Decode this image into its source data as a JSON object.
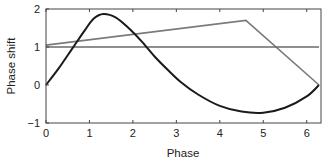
{
  "chart_data": {
    "type": "line",
    "title": "",
    "xlabel": "Phase",
    "ylabel": "Phase shift",
    "xlim": [
      0,
      6.283
    ],
    "ylim": [
      -1,
      2
    ],
    "xticks": [
      0,
      1,
      2,
      3,
      4,
      5,
      6
    ],
    "yticks": [
      -1,
      0,
      1,
      2
    ],
    "xtick_labels": [
      "0",
      "1",
      "2",
      "3",
      "4",
      "5",
      "6"
    ],
    "ytick_labels": [
      "−1",
      "0",
      "1",
      "2"
    ],
    "grid": false,
    "legend": null,
    "series": [
      {
        "name": "phase-response-curve",
        "color": "#1a1a1a",
        "x": [
          0,
          0.3,
          0.6,
          0.9,
          1.1,
          1.32,
          1.6,
          1.9,
          2.2,
          2.5,
          2.8,
          3.1,
          3.5,
          4.0,
          4.5,
          5.0,
          5.5,
          6.0,
          6.283
        ],
        "y": [
          0,
          0.45,
          0.95,
          1.45,
          1.75,
          1.87,
          1.78,
          1.5,
          1.15,
          0.75,
          0.4,
          0.08,
          -0.25,
          -0.55,
          -0.7,
          -0.73,
          -0.6,
          -0.3,
          0.0
        ]
      },
      {
        "name": "sloped-line",
        "color": "#7a7a7a",
        "x": [
          0,
          4.6,
          6.283
        ],
        "y": [
          1.05,
          1.7,
          0.0
        ]
      },
      {
        "name": "reference-line",
        "color": "#6a6a6a",
        "x": [
          0,
          6.283
        ],
        "y": [
          1.0,
          1.0
        ]
      }
    ]
  }
}
